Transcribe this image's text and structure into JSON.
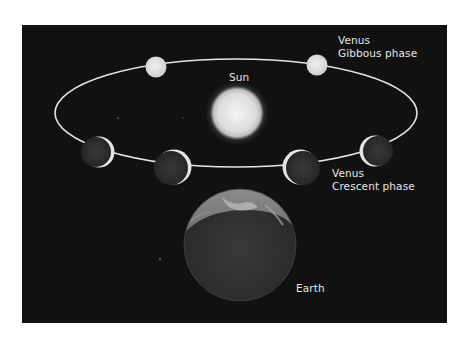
{
  "diagram": {
    "type": "astronomy-illustration",
    "background_color": "#111111",
    "labels": {
      "sun": "Sun",
      "gibbous_title": "Venus",
      "gibbous_phase": "Gibbous phase",
      "crescent_title": "Venus",
      "crescent_phase": "Crescent phase",
      "earth": "Earth"
    },
    "bodies": [
      {
        "name": "Sun",
        "shape": "glowing-disc"
      },
      {
        "name": "Venus",
        "phase": "gibbous",
        "position": "orbit-far-left"
      },
      {
        "name": "Venus",
        "phase": "gibbous",
        "position": "orbit-far-right"
      },
      {
        "name": "Venus",
        "phase": "crescent",
        "position": "orbit-left"
      },
      {
        "name": "Venus",
        "phase": "crescent",
        "position": "orbit-near-left"
      },
      {
        "name": "Venus",
        "phase": "crescent",
        "position": "orbit-near-right"
      },
      {
        "name": "Venus",
        "phase": "crescent",
        "position": "orbit-right"
      },
      {
        "name": "Earth",
        "shape": "partially-lit-sphere"
      }
    ],
    "orbit": {
      "shape": "ellipse",
      "color": "#e8e8e8"
    }
  }
}
